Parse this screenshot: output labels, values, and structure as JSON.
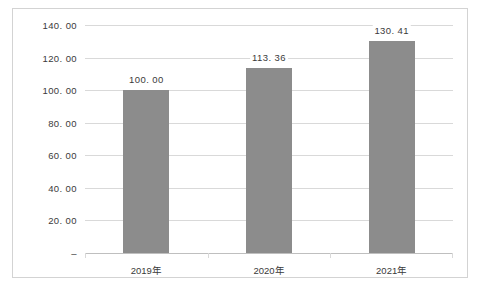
{
  "chart_data": {
    "type": "bar",
    "title": "",
    "subtitle": "",
    "xlabel": "",
    "ylabel": "",
    "categories": [
      "2019年",
      "2020年",
      "2021年"
    ],
    "values": [
      100.0,
      113.36,
      130.41
    ],
    "data_labels": [
      "100. 00",
      "113. 36",
      "130. 41"
    ],
    "series": [
      {
        "name": "",
        "values": [
          100.0,
          113.36,
          130.41
        ],
        "color": "#8c8c8c"
      }
    ],
    "ylim": [
      0,
      140
    ],
    "ytick_values": [
      140,
      120,
      100,
      80,
      60,
      40,
      20,
      0
    ],
    "ytick_labels": [
      "140. 00",
      "120. 00",
      "100. 00",
      "80. 00",
      "60. 00",
      "40. 00",
      "20. 00",
      "–"
    ],
    "grid": true,
    "legend": false,
    "legend_position": "none",
    "colors": {
      "bar": "#8c8c8c",
      "gridline": "#d9d9d9",
      "axis": "#bfbfbf",
      "frame": "#d3d3d3",
      "text": "#3a3a3a",
      "background": "#ffffff"
    }
  }
}
